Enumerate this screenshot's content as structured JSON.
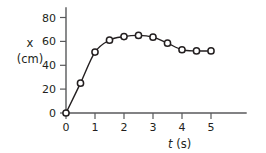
{
  "chart_data": {
    "type": "line",
    "title": "",
    "subtitle": "",
    "xlabel": "t (s)",
    "xlabel_symbol": "t",
    "xlabel_unit": "(s)",
    "ylabel": "x (cm)",
    "ylabel_symbol": "x",
    "ylabel_unit": "(cm)",
    "xlim": [
      0,
      5.6
    ],
    "ylim": [
      0,
      85
    ],
    "xticks": [
      0,
      1,
      2,
      3,
      4,
      5
    ],
    "xtick_labels": [
      "0",
      "1",
      "2",
      "3",
      "4",
      "5"
    ],
    "yticks": [
      0,
      20,
      40,
      60,
      80
    ],
    "ytick_labels": [
      "0",
      "20",
      "40",
      "60",
      "80"
    ],
    "grid": false,
    "legend": null,
    "marker": "open-circle",
    "line_color": "#231f20",
    "marker_fill": "#ffffff",
    "axis_color": "#58595b",
    "background": "#ffffff",
    "x": [
      0,
      0.5,
      1.0,
      1.5,
      2.0,
      2.5,
      3.0,
      3.5,
      4.0,
      4.5,
      5.0
    ],
    "values": [
      0,
      25,
      51,
      61,
      64,
      65,
      63.5,
      58.5,
      53,
      52,
      52
    ],
    "series": [
      {
        "name": "position",
        "x": [
          0,
          0.5,
          1.0,
          1.5,
          2.0,
          2.5,
          3.0,
          3.5,
          4.0,
          4.5,
          5.0
        ],
        "values": [
          0,
          25,
          51,
          61,
          64,
          65,
          63.5,
          58.5,
          53,
          52,
          52
        ]
      }
    ]
  }
}
